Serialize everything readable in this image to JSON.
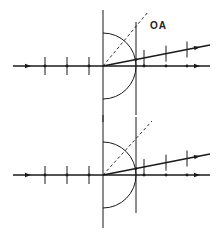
{
  "figure": {
    "label": "OA",
    "stroke_color": "#1a1a1a",
    "background": "#ffffff",
    "panels": [
      {
        "name": "upper",
        "axis_y": 66,
        "origin_x": 103,
        "left_vertical": {
          "x": 103,
          "y1": 10,
          "y2": 122
        },
        "right_vertical": {
          "x": 136,
          "y1": 22,
          "y2": 115
        },
        "semicircle_radius": 33,
        "incident_ticks_x": [
          45,
          67,
          89
        ],
        "transmitted_ticks_x": [
          144,
          166,
          187
        ],
        "refracted_ray_end": {
          "x": 210,
          "y": 45
        },
        "dashed_end": {
          "x": 148,
          "y": 12
        },
        "show_label": true
      },
      {
        "name": "lower",
        "axis_y": 175,
        "origin_x": 103,
        "left_vertical": {
          "x": 103,
          "y1": 115,
          "y2": 228
        },
        "right_vertical": {
          "x": 136,
          "y1": 117,
          "y2": 213
        },
        "semicircle_radius": 33,
        "incident_ticks_x": [
          45,
          67,
          89
        ],
        "transmitted_ticks_x": [
          144,
          166,
          187
        ],
        "refracted_ray_end": {
          "x": 210,
          "y": 154
        },
        "dashed_end": {
          "x": 152,
          "y": 121
        },
        "show_label": false
      }
    ]
  }
}
